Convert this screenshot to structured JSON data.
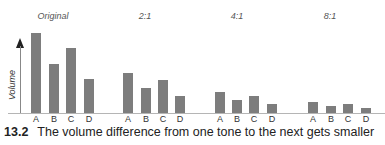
{
  "chart_data": {
    "type": "bar",
    "title": "",
    "xlabel": "",
    "ylabel": "Volume",
    "ylim": [
      0,
      100
    ],
    "grid": false,
    "legend": null,
    "categories": [
      "A",
      "B",
      "C",
      "D"
    ],
    "series": [
      {
        "name": "Original",
        "values": [
          100,
          61,
          81,
          43
        ]
      },
      {
        "name": "2:1",
        "values": [
          50,
          31,
          41,
          21
        ]
      },
      {
        "name": "4:1",
        "values": [
          26,
          16,
          21,
          11
        ]
      },
      {
        "name": "8:1",
        "values": [
          14,
          9,
          11,
          6
        ]
      }
    ]
  },
  "figure": {
    "ylabel": "Volume",
    "bar_color": "#7d7d7d",
    "panels": [
      {
        "title": "Original",
        "title_x": 31,
        "bar_x": [
          31,
          49,
          66,
          84
        ]
      },
      {
        "title": "2:1",
        "title_x": 122,
        "bar_x": [
          123,
          141,
          158,
          175
        ]
      },
      {
        "title": "4:1",
        "title_x": 215,
        "bar_x": [
          215,
          232,
          249,
          267
        ]
      },
      {
        "title": "8:1",
        "title_x": 308,
        "bar_x": [
          308,
          326,
          343,
          361
        ]
      }
    ],
    "caption": {
      "number": "13.2",
      "text": "The volume difference from one tone to the next gets smaller"
    }
  }
}
